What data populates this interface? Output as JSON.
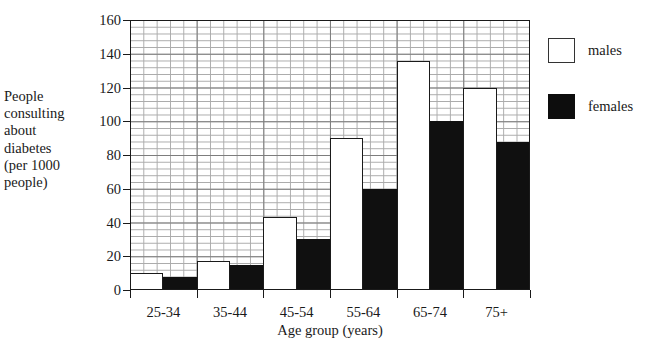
{
  "chart_data": {
    "type": "bar",
    "title": "",
    "categories": [
      "25-34",
      "35-44",
      "45-54",
      "55-64",
      "65-74",
      "75+"
    ],
    "series": [
      {
        "name": "males",
        "values": [
          10,
          17,
          43,
          90,
          136,
          120
        ],
        "color": "#ffffff"
      },
      {
        "name": "females",
        "values": [
          8,
          15,
          30,
          60,
          100,
          88
        ],
        "color": "#101010"
      }
    ],
    "xlabel": "Age group (years)",
    "ylabel": "People consulting about diabetes (per 1000 people)",
    "ylim": [
      0,
      160
    ],
    "ytick_values": [
      0,
      20,
      40,
      60,
      80,
      100,
      120,
      140,
      160
    ],
    "ytick_labels": [
      "0",
      "20",
      "40",
      "60",
      "80",
      "100",
      "120",
      "140",
      "160"
    ],
    "grid": "graph-paper minor every 4 units, major every 20 units",
    "legend_position": "right"
  },
  "axes": {
    "y_caption": "People\nconsulting\nabout\ndiabetes\n(per 1000\npeople)",
    "x_caption": "Age group (years)"
  },
  "legend": {
    "items": [
      {
        "label": "males",
        "swatch": "white-square-outline"
      },
      {
        "label": "females",
        "swatch": "black-filled-square"
      }
    ]
  }
}
